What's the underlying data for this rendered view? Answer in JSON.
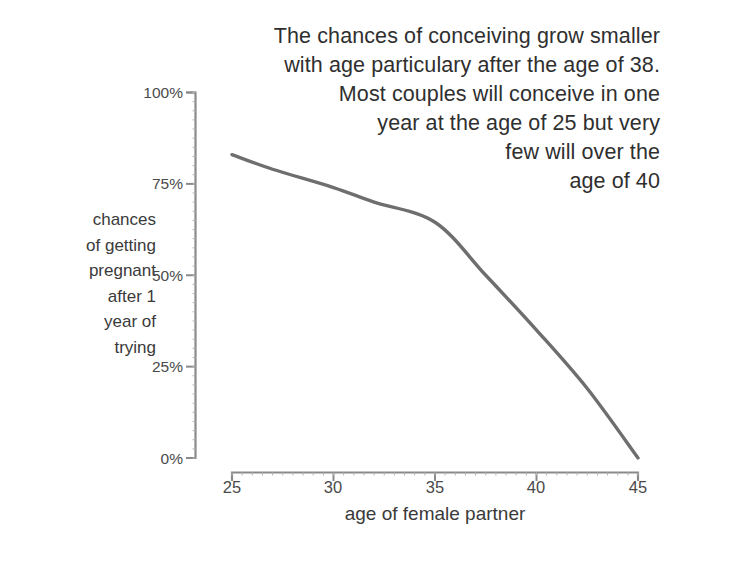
{
  "chart_data": {
    "type": "line",
    "title": "The chances of conceiving grow smaller\nwith age particulary after the age of 38.\nMost couples will conceive in one\nyear at the age of 25 but very\nfew will over the\nage of 40",
    "xlabel": "age of female partner",
    "ylabel": "chances\nof getting\npregnant\nafter 1\nyear of\ntrying",
    "x": [
      25,
      27,
      30,
      32,
      35,
      37.5,
      40,
      42.5,
      45
    ],
    "values": [
      83,
      79,
      74,
      70,
      64.5,
      50,
      35,
      19,
      0
    ],
    "xlim": [
      25,
      45
    ],
    "ylim": [
      0,
      100
    ],
    "xticks": [
      25,
      30,
      35,
      40,
      45
    ],
    "xtick_labels": [
      "25",
      "30",
      "35",
      "40",
      "45"
    ],
    "yticks": [
      0,
      25,
      50,
      75,
      100
    ],
    "ytick_labels": [
      "0%",
      "25%",
      "50%",
      "75%",
      "100%"
    ],
    "grid": false,
    "legend": false,
    "series_color": "#6e6e6e",
    "axis_color": "#8a8a8a",
    "text_color": "#3a3a3a"
  }
}
